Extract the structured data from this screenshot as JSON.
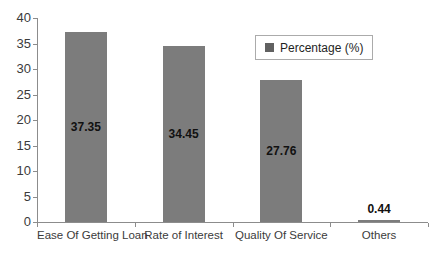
{
  "chart_data": {
    "type": "bar",
    "title": "",
    "categories": [
      "Ease Of Getting Loan",
      "Rate of Interest",
      "Quality Of Service",
      "Others"
    ],
    "series": [
      {
        "name": "Percentage (%)",
        "values": [
          37.35,
          34.45,
          27.76,
          0.44
        ]
      }
    ],
    "data_labels": [
      "37.35",
      "34.45",
      "27.76",
      "0.44"
    ],
    "xlabel": "",
    "ylabel": "",
    "ylim": [
      0,
      40
    ],
    "yticks": [
      0,
      5,
      10,
      15,
      20,
      25,
      30,
      35,
      40
    ],
    "grid": "off",
    "legend_position": "upper-right-inside",
    "bar_color": "#7c7c7c",
    "data_label_color": "#111111"
  },
  "legend": {
    "label": "Percentage (%)",
    "marker_color": "#616161"
  },
  "colors": {
    "axis": "#8c8c8c",
    "tick_text": "#3b3b3b",
    "background": "#ffffff"
  }
}
